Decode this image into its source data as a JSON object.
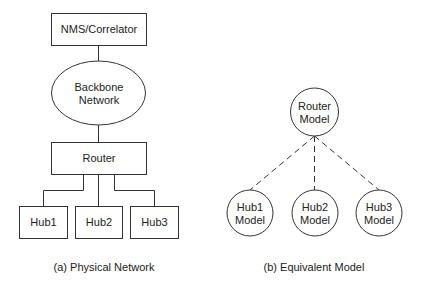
{
  "physical": {
    "nms": "NMS/Correlator",
    "backbone_line1": "Backbone",
    "backbone_line2": "Network",
    "router": "Router",
    "hubs": [
      "Hub1",
      "Hub2",
      "Hub3"
    ],
    "caption": "(a) Physical Network"
  },
  "model": {
    "router_line1": "Router",
    "router_line2": "Model",
    "hubs": [
      {
        "line1": "Hub1",
        "line2": "Model"
      },
      {
        "line1": "Hub2",
        "line2": "Model"
      },
      {
        "line1": "Hub3",
        "line2": "Model"
      }
    ],
    "caption": "(b) Equivalent Model"
  }
}
